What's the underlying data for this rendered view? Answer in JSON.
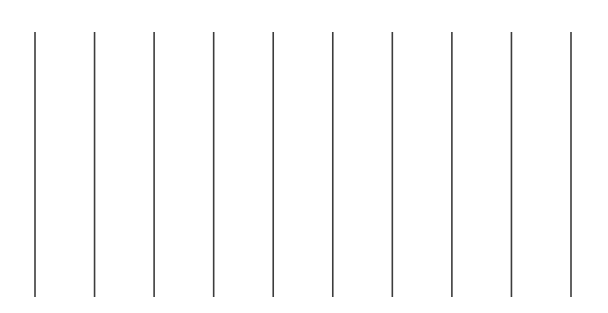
{
  "figure": {
    "line_count": 10,
    "line_color": "#3c3c3c",
    "background_color": "#ffffff",
    "lines": [
      {
        "index": 1
      },
      {
        "index": 2
      },
      {
        "index": 3
      },
      {
        "index": 4
      },
      {
        "index": 5
      },
      {
        "index": 6
      },
      {
        "index": 7
      },
      {
        "index": 8
      },
      {
        "index": 9
      },
      {
        "index": 10
      }
    ]
  }
}
